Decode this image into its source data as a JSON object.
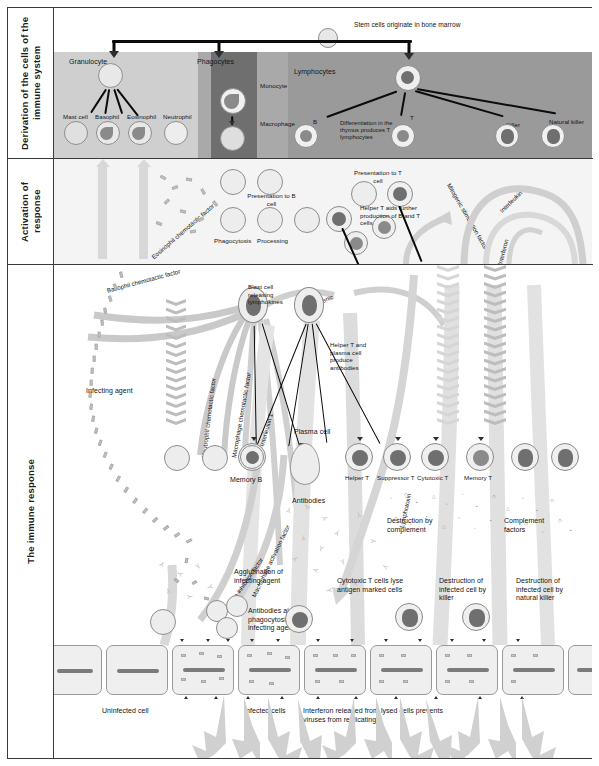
{
  "figure": {
    "sections": [
      {
        "id": "derivation",
        "label": "Derivation of the cells\nof the immune system"
      },
      {
        "id": "activation",
        "label": "Activation of\nresponse"
      },
      {
        "id": "response",
        "label": "The immune response"
      }
    ]
  },
  "derivation": {
    "stem_note": "Stem cells originate\nin bone marrow",
    "bands": [
      {
        "name": "Granulocyte",
        "color": "#cfcfcf"
      },
      {
        "name": "Phagocytes",
        "color": "#a9a9a9"
      },
      {
        "name": "Lymphocytes",
        "color": "#9a9a9a"
      }
    ],
    "granulocytes": [
      "Mast cell",
      "Basophil",
      "Eosinophil",
      "Neutrophil"
    ],
    "phagocytes": [
      "Monocyte",
      "Macrophage"
    ],
    "lymphocytes": [
      "B",
      "T",
      "Killer",
      "Natural killer"
    ],
    "thymus_note": "Differentiation in\nthe thymus\nproduces T\nlymphocytes"
  },
  "activation": {
    "phagocytosis": "Phagocytosis",
    "processing": "Processing",
    "presentation_b": "Presentation\nto B cell",
    "presentation_t": "Presentation\nto T cell",
    "helper_note": "Helper T aids\nfurther production\nof B and T cells",
    "factors": [
      "Eosinophil chemotactic factor",
      "Basophil chemotactic factor",
      "Mitogenic stimulation factor",
      "Interleukin 2",
      "Interferon"
    ]
  },
  "response": {
    "infecting_agent": "Infecting agent",
    "mitogenic": "Mitogenic",
    "blast_note": "Blast cell\nreleasing\nlymphokines",
    "helper_plasma_note": "Helper T and\nplasma cell\nproduce\nantibodies",
    "factors_vertical": [
      "Neutrophil chemotactic factor",
      "Macrophage chemotactic factor",
      "Interleukin 1",
      "Macrophage inhibition factor",
      "Macrophage activation factor",
      "Lymphotoxin"
    ],
    "cells": [
      "Memory B",
      "Plasma cell",
      "Helper T",
      "Suppressor T",
      "Cytotoxic T",
      "Memory T"
    ],
    "antibodies": "Antibodies",
    "destruction_complement": "Destruction by\ncomplement",
    "complement_factors": "Complement\nfactors",
    "agglutination": "Agglutination of\ninfecting agent",
    "antibodies_aid": "Antibodies aid\nphagocytosis of\ninfecting agent",
    "cytotoxic_note": "Cytotoxic T cells\nlyse antigen\nmarked cells",
    "destruction_killer": "Destruction of\ninfected cell\nby killer",
    "destruction_nk": "Destruction of\ninfected cell by\nnatural killer",
    "uninfected": "Uninfected cell",
    "infected": "Infected cells",
    "interferon_note": "Interferon released from lysed cells\nprevents viruses from replicating"
  },
  "palette": {
    "ink": "#141414",
    "band_light": "#cfcfcf",
    "band_mid": "#a9a9a9",
    "band_dark": "#8f8f8f",
    "ribbon": "#c9c9c9",
    "cell_fill": "#e8e8e8",
    "nucleus": "#8a8a8a"
  }
}
